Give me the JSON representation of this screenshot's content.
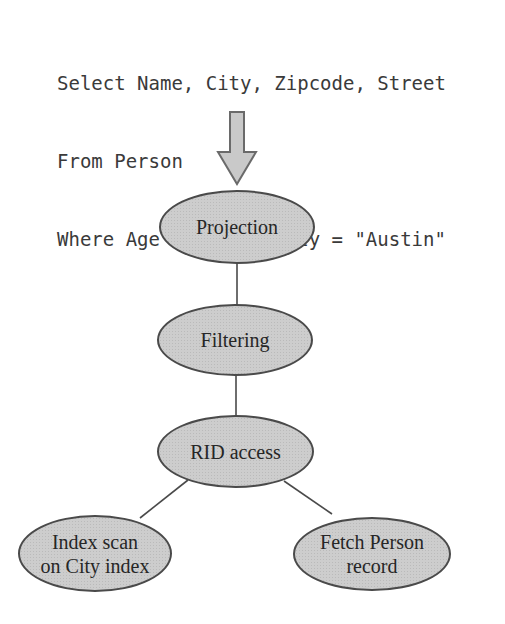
{
  "query": {
    "lines": [
      "Select Name, City, Zipcode, Street",
      "From Person",
      "Where Age < 30 And City = \"Austin\""
    ]
  },
  "tree": {
    "nodes": [
      {
        "id": "projection",
        "lines": [
          "Projection"
        ]
      },
      {
        "id": "filtering",
        "lines": [
          "Filtering"
        ]
      },
      {
        "id": "rid-access",
        "lines": [
          "RID access"
        ]
      },
      {
        "id": "index-scan",
        "lines": [
          "Index scan",
          "on City index"
        ]
      },
      {
        "id": "fetch-person",
        "lines": [
          "Fetch Person",
          "record"
        ]
      }
    ]
  },
  "colors": {
    "background": "#ffffff",
    "node_fill": "#cdcdcd",
    "node_border": "#4a4a4a",
    "shape_fill": "#c9c9c9",
    "shape_border": "#6a6a6a",
    "edge": "#4a4a4a",
    "text": "#2e2e2e"
  }
}
